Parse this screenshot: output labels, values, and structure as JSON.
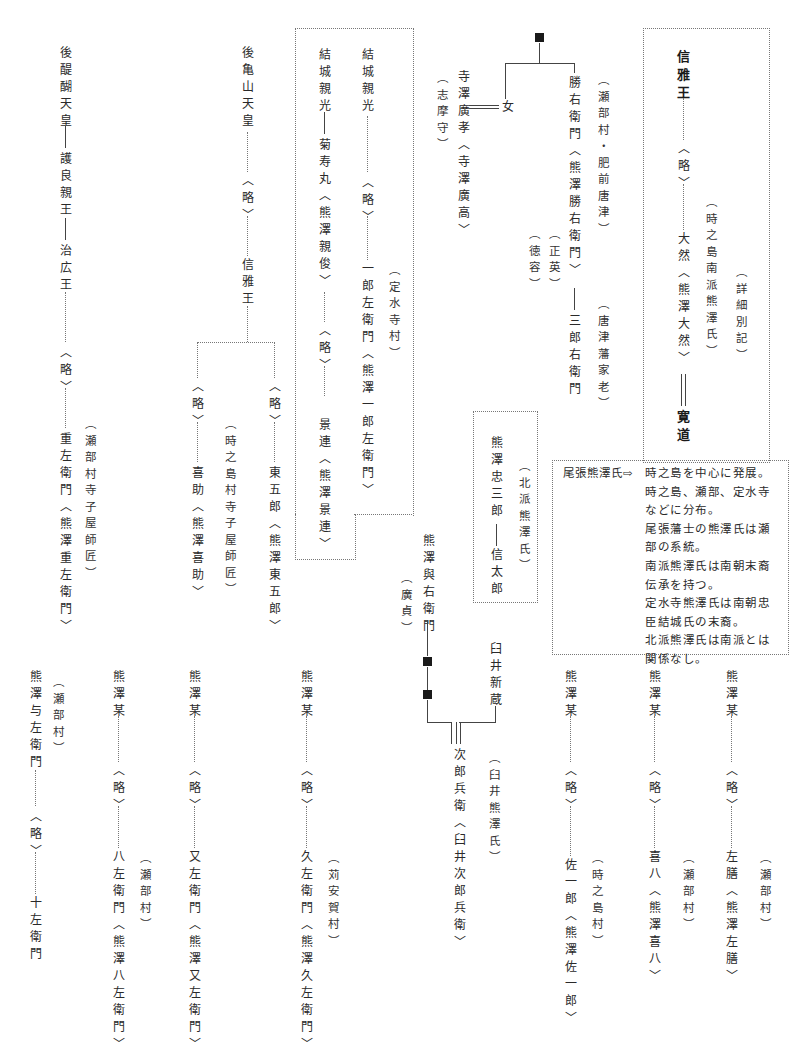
{
  "document": {
    "type": "genealogy-chart",
    "orientation": "vertical-japanese"
  },
  "columns": {
    "godaigo": {
      "line1": "後醍醐天皇",
      "line2": "護良親王",
      "line3": "治広王",
      "ryaku": "〈略〉",
      "desc": "重左衛門〈熊澤重左衛門〉",
      "note": "（瀬部村寺子屋師匠）"
    },
    "gokameyama": {
      "line1": "後亀山天皇",
      "ryaku": "〈略〉",
      "line2": "信雅王",
      "branch_left_ryaku": "〈略〉",
      "branch_left": "喜助〈熊澤喜助〉",
      "branch_left_note": "（時之島村寺子屋師匠）",
      "branch_right_ryaku": "〈略〉",
      "branch_right": "東五郎〈熊澤東五郎〉"
    },
    "yuki_box": {
      "col_a_top": "結城親光",
      "col_a_child": "菊寿丸〈熊澤親俊〉",
      "col_a_ryaku": "〈略〉",
      "col_a_desc": "景連〈熊澤景連〉",
      "col_b_top": "結城親光",
      "col_b_ryaku": "〈略〉",
      "col_b_desc": "一郎左衛門〈熊澤一郎左衛門〉",
      "col_b_note": "（定水寺村）"
    },
    "terasawa": {
      "name": "寺澤廣孝〈寺澤廣高〉",
      "note": "（志摩守）",
      "spouse": "女"
    },
    "katsu": {
      "name": "勝右衛門〈熊澤勝右衛門〉",
      "note_a": "（瀬部村・肥前唐津）",
      "note_b": "（正英）",
      "note_c": "（徳容）",
      "child": "三郎右衛門",
      "child_note": "（唐津藩家老）"
    },
    "nobumasa_box": {
      "top": "信雅王",
      "ryaku": "〈略〉",
      "desc": "大然〈熊澤大然〉",
      "note_a": "（時之島南派熊澤氏）",
      "note_b": "（詳細別記）",
      "child": "寛道"
    },
    "hokuha_box": {
      "line1": "熊澤忠三郎",
      "line2": "信太郎",
      "note": "（北派熊澤氏）"
    },
    "yoemon": {
      "name": "熊澤與右衛門",
      "note": "（廣貞）"
    },
    "usui": {
      "name": "臼井新蔵",
      "child": "次郎兵衛〈臼井次郎兵衛〉",
      "note": "（臼井熊澤氏）"
    },
    "bottom": [
      {
        "top": "熊澤与左衛門",
        "note": "（瀬部村）",
        "ryaku": "〈略〉",
        "desc": "十左衛門"
      },
      {
        "top": "熊澤某",
        "ryaku": "〈略〉",
        "desc": "八左衛門〈熊澤八左衛門〉",
        "note": "（瀬部村）"
      },
      {
        "top": "熊澤某",
        "ryaku": "〈略〉",
        "desc": "又左衛門〈熊澤又左衛門〉"
      },
      {
        "top": "熊澤某",
        "ryaku": "〈略〉",
        "desc": "久左衛門〈熊澤久左衛門〉",
        "note": "（苅安賀村）"
      },
      {
        "top": "熊澤某",
        "ryaku": "〈略〉",
        "desc": "佐一郎〈熊澤佐一郎〉",
        "note": "（時之島村）"
      },
      {
        "top": "熊澤某",
        "ryaku": "〈略〉",
        "desc": "喜八〈熊澤喜八〉",
        "note": "（瀬部村）"
      },
      {
        "top": "熊澤某",
        "ryaku": "〈略〉",
        "desc": "左膳〈熊澤左膳〉",
        "note": "（瀬部村）"
      }
    ]
  },
  "legend": {
    "lead": "尾張熊澤氏⇨",
    "lines": [
      "時之島を中心に発展。",
      "時之島、瀬部、定水寺",
      "などに分布。",
      "尾張藩士の熊澤氏は瀬",
      "部の系統。",
      "南派熊澤氏は南朝末裔",
      "伝承を持つ。",
      "定水寺熊澤氏は南朝忠",
      "臣結城氏の末裔。",
      "北派熊澤氏は南派とは",
      "関係なし。"
    ]
  }
}
